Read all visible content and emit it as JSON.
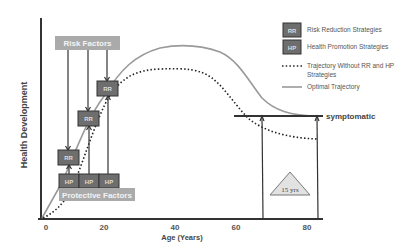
{
  "diagram": {
    "y_axis_label": "Health Development",
    "x_axis_label": "Age (Years)",
    "x_ticks": [
      "0",
      "20",
      "40",
      "60",
      "80"
    ],
    "risk_factors_label": "Risk Factors",
    "protective_factors_label": "Protective Factors",
    "rr_boxes": [
      "RR",
      "RR",
      "RR"
    ],
    "hp_boxes": [
      "HP",
      "HP",
      "HP"
    ],
    "threshold_label": "symptomatic",
    "gap_label": "15 yrs",
    "legend": [
      {
        "marker": "RR",
        "label": "Risk Reduction Strategies"
      },
      {
        "marker": "HP",
        "label": "Health Promotion Strategies"
      },
      {
        "marker": "dotted-line",
        "label_line1": "Trajectory Without RR and HP",
        "label_line2": "Strategies"
      },
      {
        "marker": "solid-line",
        "label": "Optimal Trajectory"
      }
    ],
    "colors": {
      "optimal_line": "#9a9a9a",
      "dotted_line": "#222222",
      "label_box": "#aaaaaa",
      "strategy_box": "#6e6e6e"
    }
  }
}
